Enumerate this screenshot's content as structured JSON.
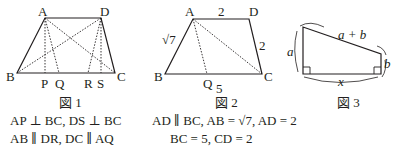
{
  "figures": [
    {
      "id": "fig1",
      "caption": "図 1",
      "points": {
        "A": "A",
        "D": "D",
        "B": "B",
        "C": "C",
        "P": "P",
        "Q": "Q",
        "R": "R",
        "S": "S"
      },
      "conditions": [
        "AP ⊥ BC, DS ⊥ BC",
        "AB ∥ DR, DC ∥ AQ"
      ],
      "dotted_segments": [
        "AP",
        "AQ",
        "AC",
        "DB",
        "DR",
        "DS"
      ]
    },
    {
      "id": "fig2",
      "caption": "図 2",
      "points": {
        "A": "A",
        "D": "D",
        "B": "B",
        "C": "C",
        "Q": "Q"
      },
      "side_labels": {
        "AD": "2",
        "CD": "2",
        "AB": "√7",
        "BC": "5"
      },
      "conditions": [
        "AD ∥ BC, AB = √7, AD = 2",
        "BC = 5, CD = 2"
      ],
      "dotted_segments": [
        "AQ",
        "AC"
      ]
    },
    {
      "id": "fig3",
      "caption": "図 3",
      "side_labels": {
        "left": "a",
        "right": "b",
        "top": "a + b",
        "bottom": "x"
      },
      "right_angles": 2
    }
  ]
}
